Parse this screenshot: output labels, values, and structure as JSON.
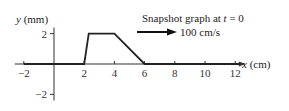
{
  "chart_data": {
    "type": "line",
    "title": "Snapshot graph at t = 0",
    "title_prefix": "Snapshot graph at ",
    "title_var": "t",
    "title_suffix": " = 0",
    "velocity_label": "100 cm/s",
    "velocity_direction": "right",
    "xlabel": "x (cm)",
    "xlabel_var": "x",
    "xlabel_unit": " (cm)",
    "ylabel": "y (mm)",
    "ylabel_var": "y",
    "ylabel_unit": " (mm)",
    "xlim": [
      -2,
      12.3
    ],
    "ylim": [
      -2,
      2
    ],
    "xticks": [
      -2,
      2,
      4,
      6,
      8,
      10,
      12
    ],
    "xtick_labels": [
      "−2",
      "2",
      "4",
      "6",
      "8",
      "10",
      "12"
    ],
    "yticks": [
      2,
      -2
    ],
    "ytick_labels": [
      "2",
      "−2"
    ],
    "grid": false,
    "series": [
      {
        "name": "pulse",
        "x": [
          -2,
          2,
          2.3,
          4,
          6,
          12.3
        ],
        "y": [
          0,
          0,
          2,
          2,
          0,
          0
        ]
      }
    ]
  }
}
